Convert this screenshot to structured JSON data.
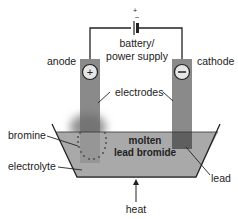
{
  "diagram": {
    "battery": {
      "label_line1": "battery/",
      "label_line2": "power supply",
      "plus_sign": "+",
      "minus_sign": "–"
    },
    "anode": {
      "label": "anode",
      "sign": "+"
    },
    "cathode": {
      "label": "cathode",
      "sign": "–"
    },
    "electrodes_label": "electrodes",
    "electrolyte": {
      "label_line1": "molten",
      "label_line2": "lead bromide"
    },
    "labels": {
      "bromine": "bromine",
      "electrolyte": "electrolyte",
      "lead": "lead",
      "heat": "heat"
    },
    "colors": {
      "electrode": "#8a8a8a",
      "liquid": "#a9a9a9",
      "lead_deposit": "#5f5f5f",
      "bromine_gas": "#777777",
      "wire": "#222222"
    }
  }
}
